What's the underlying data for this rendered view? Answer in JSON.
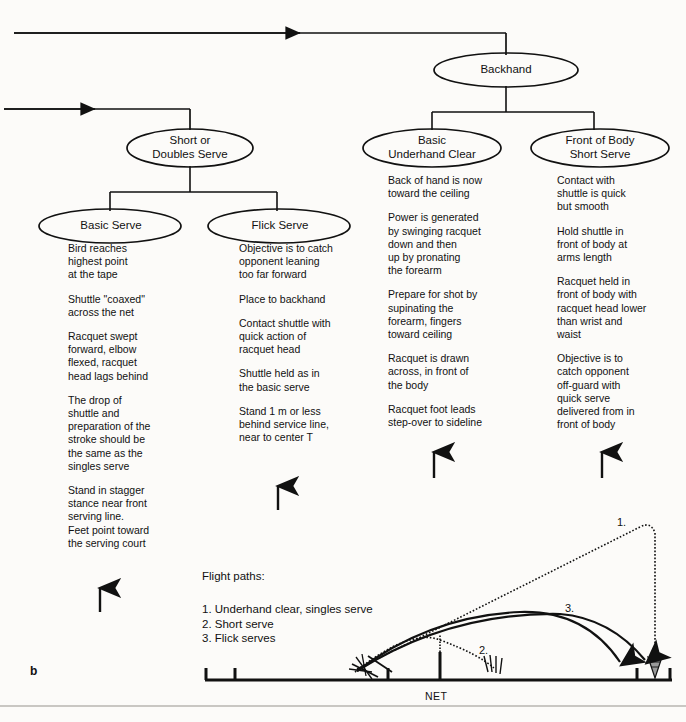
{
  "figure": {
    "letter": "b"
  },
  "tree": {
    "nodes": [
      {
        "id": "backhand",
        "label": "Backhand"
      },
      {
        "id": "short-doubles",
        "label": "Short or\nDoubles Serve"
      },
      {
        "id": "basic-underhand",
        "label": "Basic\nUnderhand Clear"
      },
      {
        "id": "front-body",
        "label": "Front of Body\nShort Serve"
      },
      {
        "id": "basic-serve",
        "label": "Basic Serve"
      },
      {
        "id": "flick-serve",
        "label": "Flick Serve"
      }
    ]
  },
  "columns": [
    {
      "id": "basic-serve-notes",
      "points": [
        "Bird reaches\nhighest point\nat the tape",
        "Shuttle  \"coaxed\"\nacross the net",
        "Racquet swept\nforward, elbow\nflexed, racquet\nhead lags behind",
        "The drop of\nshuttle and\npreparation of the\nstroke should be\nthe same as the\nsingles serve",
        "Stand in stagger\nstance near front\nserving line.\nFeet point toward\nthe serving court"
      ]
    },
    {
      "id": "flick-serve-notes",
      "points": [
        "Objective is to catch\nopponent leaning\ntoo far forward",
        "Place to backhand",
        "Contact shuttle with\nquick action of\nracquet head",
        "Shuttle held as in\nthe basic serve",
        "Stand 1 m or less\nbehind service line,\nnear to center T"
      ]
    },
    {
      "id": "basic-underhand-clear-notes",
      "points": [
        "Back of hand is now\ntoward the ceiling",
        "Power is generated\nby swinging racquet\ndown and then\nup by pronating\nthe forearm",
        "Prepare for shot by\nsupinating the\nforearm, fingers\ntoward ceiling",
        "Racquet is drawn\nacross, in front of\nthe body",
        "Racquet foot leads\nstep-over to sideline"
      ]
    },
    {
      "id": "front-of-body-short-serve-notes",
      "points": [
        "Contact with\nshuttle is quick\nbut smooth",
        "Hold shuttle in\nfront of body at\narms length",
        "Racquet held in\nfront of body with\nracquet head lower\nthan wrist and\nwaist",
        "Objective is to\ncatch opponent\noff-guard with\nquick serve\ndelivered from in\nfront of body"
      ]
    }
  ],
  "flight_paths": {
    "title": "Flight paths:",
    "legend": [
      "1. Underhand clear, singles serve",
      "2. Short serve",
      "3. Flick serves"
    ],
    "net_label": "NET",
    "path_markers": [
      "1.",
      "2.",
      "3."
    ]
  }
}
